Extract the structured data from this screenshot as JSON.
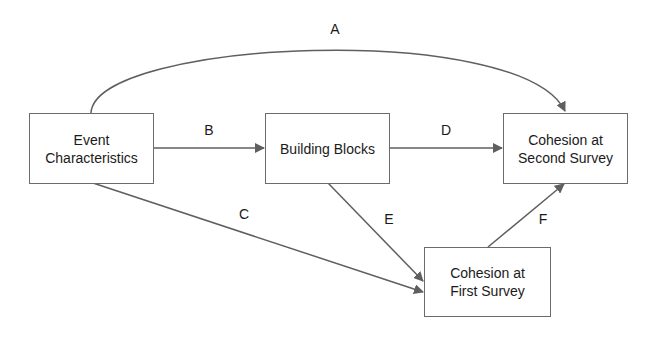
{
  "nodes": {
    "event": {
      "line1": "Event",
      "line2": "Characteristics"
    },
    "blocks": {
      "line1": "Building Blocks"
    },
    "second": {
      "line1": "Cohesion at",
      "line2": "Second Survey"
    },
    "first": {
      "line1": "Cohesion at",
      "line2": "First Survey"
    }
  },
  "edges": {
    "A": "A",
    "B": "B",
    "C": "C",
    "D": "D",
    "E": "E",
    "F": "F"
  },
  "colors": {
    "line": "#5f5f5f",
    "border": "#6b6b6b"
  }
}
